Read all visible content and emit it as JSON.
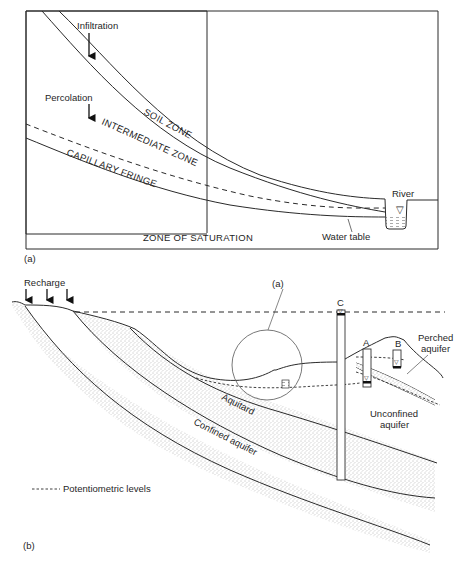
{
  "panel_a": {
    "caption": "(a)",
    "labels": {
      "infiltration": "Infiltration",
      "percolation": "Percolation",
      "soil_zone": "SOIL ZONE",
      "intermediate_zone": "INTERMEDIATE ZONE",
      "capillary_fringe": "CAPILLARY FRINGE",
      "zone_of_saturation": "ZONE OF SATURATION",
      "river": "River",
      "water_table": "Water table"
    }
  },
  "panel_b": {
    "caption": "(b)",
    "labels": {
      "recharge": "Recharge",
      "inset_ref": "(a)",
      "well_a": "A",
      "well_b": "B",
      "well_c": "C",
      "perched_aquifer_1": "Perched",
      "perched_aquifer_2": "aquifer",
      "unconfined_aquifer_1": "Unconfined",
      "unconfined_aquifer_2": "aquifer",
      "aquitard": "Aquitard",
      "confined_aquifer": "Confined aquifer"
    },
    "legend": {
      "potentiometric": "Potentiometric levels"
    }
  },
  "symbols": {
    "water_level": "▽"
  }
}
